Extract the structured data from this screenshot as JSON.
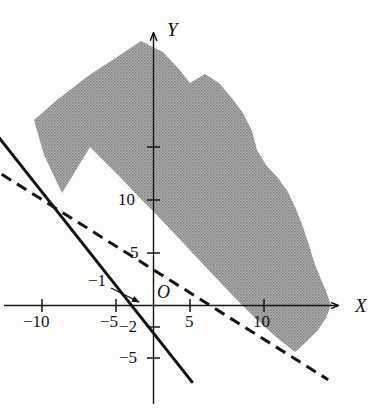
{
  "figure": {
    "kind": "cartesian-plot",
    "background_color": "#fdfdfc",
    "ink_color": "#141414",
    "shade_color": "#9a9a9a",
    "axis_label_x": "X",
    "axis_label_y": "Y",
    "origin_label": "O",
    "callout_label": "−1"
  },
  "caption": {
    "text": ""
  },
  "chart_data": {
    "type": "line",
    "title": "",
    "subtitle": "",
    "xlabel": "X",
    "ylabel": "Y",
    "origin_label": "O",
    "xlim": [
      -15,
      16
    ],
    "ylim": [
      -8,
      21
    ],
    "grid": false,
    "legend": "none",
    "x_ticks": [
      -10,
      -5,
      5,
      10
    ],
    "x_tick_labels": [
      "−10",
      "−5",
      "5",
      "10"
    ],
    "y_ticks": [
      -5,
      -2,
      5,
      10,
      15
    ],
    "y_tick_labels": [
      "−5",
      "−2",
      "5",
      "10",
      ""
    ],
    "annotations": [
      {
        "name": "x-intercept-callout",
        "text": "−1",
        "points_to_x": -1,
        "points_to_y": 0
      }
    ],
    "series": [
      {
        "name": "solid-boundary-line",
        "style": "solid",
        "color": "#141414",
        "width_px": 3,
        "x_intercept": -1,
        "y_intercept": -2,
        "slope": -2,
        "points": [
          {
            "x": -14.6,
            "y": 23.2
          },
          {
            "x": 2.6,
            "y": -7.2
          }
        ]
      },
      {
        "name": "dashed-boundary-line",
        "style": "dashed",
        "color": "#141414",
        "width_px": 3,
        "x_intercept": 5,
        "y_intercept": 5,
        "slope": -1,
        "points": [
          {
            "x": -15.4,
            "y": 16.9
          },
          {
            "x": 11.8,
            "y": -7.0
          }
        ]
      }
    ],
    "shaded_region": {
      "name": "feasible-region",
      "fill": "#9a9a9a",
      "pattern": "halftone-dither",
      "description": "Region above the solid line and above the dashed line, clipped by a ragged hand-drawn outer boundary",
      "boundary_points_px": [
        [
          62,
          193
        ],
        [
          44,
          155
        ],
        [
          34,
          120
        ],
        [
          57,
          100
        ],
        [
          88,
          76
        ],
        [
          117,
          57
        ],
        [
          141,
          41
        ],
        [
          163,
          52
        ],
        [
          178,
          68
        ],
        [
          190,
          83
        ],
        [
          205,
          74
        ],
        [
          219,
          83
        ],
        [
          231,
          97
        ],
        [
          243,
          113
        ],
        [
          252,
          131
        ],
        [
          257,
          150
        ],
        [
          266,
          165
        ],
        [
          278,
          178
        ],
        [
          288,
          192
        ],
        [
          296,
          209
        ],
        [
          303,
          227
        ],
        [
          309,
          245
        ],
        [
          314,
          262
        ],
        [
          320,
          277
        ],
        [
          326,
          291
        ],
        [
          331,
          305
        ],
        [
          326,
          318
        ],
        [
          318,
          330
        ],
        [
          306,
          342
        ],
        [
          295,
          352
        ],
        [
          281,
          341
        ],
        [
          266,
          328
        ],
        [
          250,
          313
        ],
        [
          234,
          297
        ],
        [
          218,
          280
        ],
        [
          202,
          263
        ],
        [
          186,
          246
        ],
        [
          170,
          229
        ],
        [
          154,
          212
        ],
        [
          138,
          196
        ],
        [
          122,
          179
        ],
        [
          106,
          163
        ],
        [
          90,
          147
        ],
        [
          76,
          170
        ]
      ]
    }
  },
  "ticks": {
    "x": [
      {
        "label": "−10",
        "px": 42
      },
      {
        "label": "−5",
        "px": 116
      },
      {
        "label": "5",
        "px": 190
      },
      {
        "label": "10",
        "px": 264
      }
    ],
    "y": [
      {
        "label": "",
        "px": 147
      },
      {
        "label": "10",
        "px": 200
      },
      {
        "label": "5",
        "px": 253
      },
      {
        "label": "−2",
        "px": 327
      },
      {
        "label": "−5",
        "px": 358
      }
    ]
  }
}
